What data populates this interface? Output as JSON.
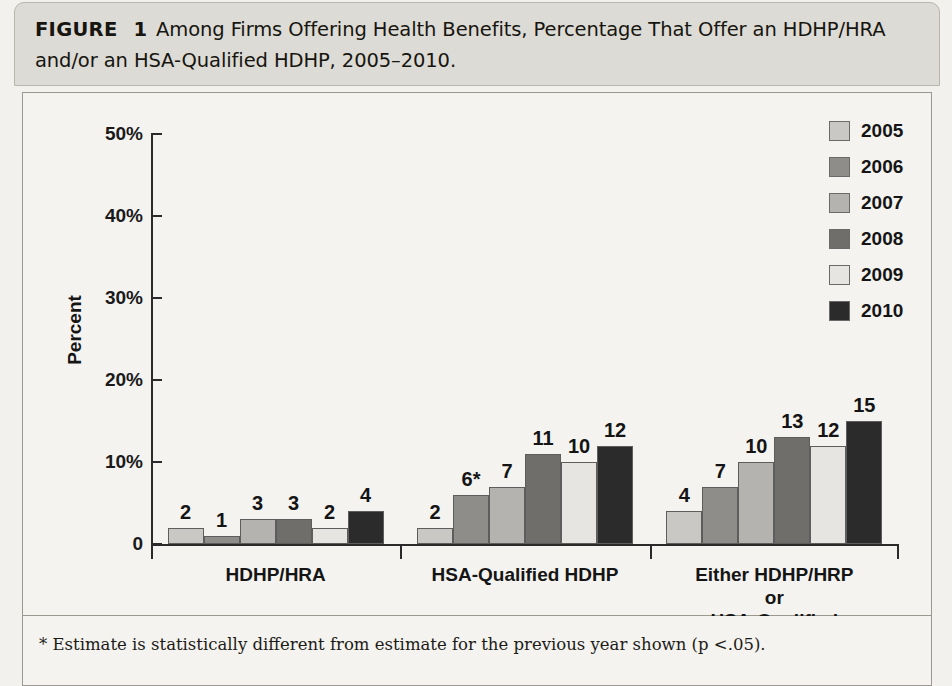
{
  "figure": {
    "label": "FIGURE",
    "number": "1",
    "caption": "Among Firms Offering Health Benefits, Percentage That Offer an HDHP/HRA and/or an HSA-Qualified HDHP, 2005–2010."
  },
  "footnote": {
    "text": "* Estimate is statistically different from estimate for the previous year shown (p <.05)."
  },
  "legend": {
    "position": "top-right",
    "entries": [
      {
        "label": "2005",
        "color": "#c9c8c5"
      },
      {
        "label": "2006",
        "color": "#8e8d8a"
      },
      {
        "label": "2007",
        "color": "#b4b3b0"
      },
      {
        "label": "2008",
        "color": "#6f6e6b"
      },
      {
        "label": "2009",
        "color": "#e6e5e2"
      },
      {
        "label": "2010",
        "color": "#2b2b2b"
      }
    ]
  },
  "chart_data": {
    "type": "bar",
    "title": "Among Firms Offering Health Benefits, Percentage That Offer an HDHP/HRA and/or an HSA-Qualified HDHP, 2005–2010.",
    "xlabel": "",
    "ylabel": "Percent",
    "ylim": [
      0,
      50
    ],
    "ytick_labels": [
      "0",
      "10%",
      "20%",
      "30%",
      "40%",
      "50%"
    ],
    "ytick_values": [
      0,
      10,
      20,
      30,
      40,
      50
    ],
    "grid": false,
    "categories": [
      "HDHP/HRA",
      "HSA-Qualified HDHP",
      "Either HDHP/HRP or\nHSA-Qualified HDHP"
    ],
    "series": [
      {
        "name": "2005",
        "color": "#c9c8c5",
        "values": [
          2,
          2,
          4
        ],
        "labels": [
          "2",
          "2",
          "4"
        ]
      },
      {
        "name": "2006",
        "color": "#8e8d8a",
        "values": [
          1,
          6,
          7
        ],
        "labels": [
          "1",
          "6*",
          "7"
        ]
      },
      {
        "name": "2007",
        "color": "#b4b3b0",
        "values": [
          3,
          7,
          10
        ],
        "labels": [
          "3",
          "7",
          "10"
        ]
      },
      {
        "name": "2008",
        "color": "#6f6e6b",
        "values": [
          3,
          11,
          13
        ],
        "labels": [
          "3",
          "11",
          "13"
        ]
      },
      {
        "name": "2009",
        "color": "#e6e5e2",
        "values": [
          2,
          10,
          12
        ],
        "labels": [
          "2",
          "10",
          "12"
        ]
      },
      {
        "name": "2010",
        "color": "#2b2b2b",
        "values": [
          4,
          12,
          15
        ],
        "labels": [
          "4",
          "12",
          "15"
        ]
      }
    ],
    "annotations": [
      "* Estimate is statistically different from estimate for the previous year shown (p <.05)."
    ]
  }
}
